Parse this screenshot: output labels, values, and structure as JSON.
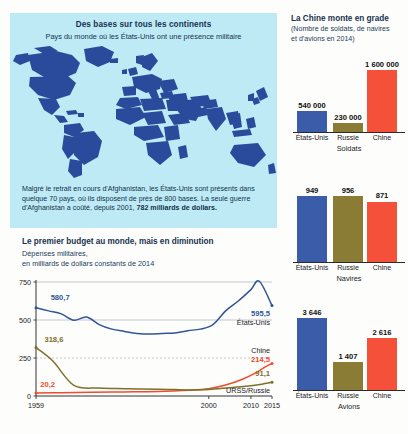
{
  "map_panel": {
    "title": "Des bases sur tous les continents",
    "subtitle": "Pays du monde où les États-Unis ont une présence militaire",
    "note_part1": "Malgré le retrait en cours d'Afghanistan, les États-Unis sont présents dans quelque 70 pays, où ils disposent de près de 800 bases. La seule guerre d'Afghanistan a coûté, depuis 2001, ",
    "note_bold": "782 milliards de dollars.",
    "colors": {
      "panel_bg": "#bdeaf5",
      "country_fill": "#2a4b9b",
      "sea": "#bdeaf5"
    }
  },
  "line_chart": {
    "title": "Le premier budget au monde, mais en diminution",
    "subtitle_line1": "Dépenses militaires,",
    "subtitle_line2": "en milliards de dollars constants de 2014"
  },
  "right_column": {
    "title": "La Chine monte en grade",
    "subtitle_line1": "(Nombre de soldats, de navires",
    "subtitle_line2": "et d'avions en 2014)"
  },
  "chart_data": [
    {
      "type": "line",
      "title": "Le premier budget au monde, mais en diminution",
      "subtitle": "Dépenses militaires, en milliards de dollars constants de 2014",
      "xlabel": "",
      "ylabel": "",
      "ylim": [
        0,
        750
      ],
      "xlim": [
        1959,
        2015
      ],
      "yticks": [
        0,
        250,
        500,
        750
      ],
      "ytick_labels": [
        "0",
        "250",
        "500",
        "750"
      ],
      "xticks": [
        1959,
        2000,
        2010,
        2015
      ],
      "xtick_labels": [
        "1959",
        "2000",
        "2010",
        "2015"
      ],
      "grid": true,
      "legend_position": "inline-right",
      "series": [
        {
          "name": "États-Unis",
          "color": "#2f5597",
          "start_label": "580,7",
          "end_label": "595,5",
          "x": [
            1959,
            1962,
            1965,
            1968,
            1971,
            1974,
            1977,
            1980,
            1983,
            1986,
            1989,
            1992,
            1995,
            1998,
            2001,
            2004,
            2007,
            2010,
            2012,
            2015
          ],
          "values": [
            580.7,
            560,
            540,
            498,
            520,
            470,
            440,
            425,
            412,
            408,
            412,
            415,
            430,
            440,
            470,
            560,
            625,
            700,
            755,
            595.5
          ]
        },
        {
          "name": "Chine",
          "color": "#ef4b2f",
          "start_label": "20,2",
          "end_label": "214,5",
          "x": [
            1959,
            1965,
            1972,
            1980,
            1988,
            1995,
            2000,
            2004,
            2008,
            2011,
            2013,
            2015
          ],
          "values": [
            20.2,
            22,
            25,
            27,
            30,
            38,
            48,
            72,
            110,
            150,
            185,
            214.5
          ]
        },
        {
          "name": "URSS/Russie",
          "color": "#7d7029",
          "start_label": "318,6",
          "end_label": "91,1",
          "x": [
            1959,
            1963,
            1968,
            1974,
            1980,
            1988,
            1992,
            1996,
            2000,
            2005,
            2010,
            2013,
            2015
          ],
          "values": [
            318.6,
            230,
            70,
            52,
            48,
            45,
            42,
            40,
            42,
            55,
            68,
            80,
            91.1
          ]
        }
      ]
    },
    {
      "type": "bar",
      "title": "Soldats",
      "unit_label": "Soldats",
      "categories": [
        "États-Unis",
        "Russie",
        "Chine"
      ],
      "values": [
        540000,
        230000,
        1600000
      ],
      "value_labels": [
        "540 000",
        "230 000",
        "1 600 000"
      ],
      "colors": [
        "#3b5ca8",
        "#8a7c35",
        "#f4503a"
      ],
      "ylim": [
        0,
        1600000
      ]
    },
    {
      "type": "bar",
      "title": "Navires",
      "unit_label": "Navires",
      "categories": [
        "États-Unis",
        "Russie",
        "Chine"
      ],
      "values": [
        949,
        956,
        871
      ],
      "value_labels": [
        "949",
        "956",
        "871"
      ],
      "colors": [
        "#3b5ca8",
        "#8a7c35",
        "#f4503a"
      ],
      "ylim": [
        0,
        956
      ]
    },
    {
      "type": "bar",
      "title": "Avions",
      "unit_label": "Avions",
      "categories": [
        "États-Unis",
        "Russie",
        "Chine"
      ],
      "values": [
        3646,
        1407,
        2616
      ],
      "value_labels": [
        "3 646",
        "1 407",
        "2 616"
      ],
      "colors": [
        "#3b5ca8",
        "#8a7c35",
        "#f4503a"
      ],
      "ylim": [
        0,
        3646
      ]
    }
  ]
}
